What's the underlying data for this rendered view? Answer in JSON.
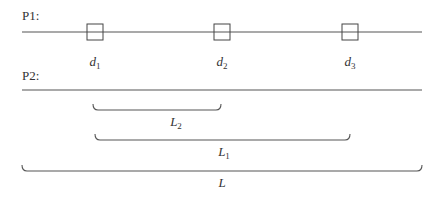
{
  "diagram": {
    "rows": [
      {
        "id": "p1",
        "label": "P1:"
      },
      {
        "id": "p2",
        "label": "P2:"
      }
    ],
    "markers": [
      {
        "id": "d1",
        "symbol": "d",
        "subscript": "1",
        "x_center": 95
      },
      {
        "id": "d2",
        "symbol": "d",
        "subscript": "2",
        "x_center": 222
      },
      {
        "id": "d3",
        "symbol": "d",
        "subscript": "3",
        "x_center": 350
      }
    ],
    "braces": [
      {
        "id": "L2",
        "symbol": "L",
        "subscript": "2",
        "x_start": 93,
        "x_end": 221,
        "label_x": 174
      },
      {
        "id": "L1",
        "symbol": "L",
        "subscript": "1",
        "x_start": 95,
        "x_end": 350,
        "label_x": 222
      },
      {
        "id": "L",
        "symbol": "L",
        "subscript": "",
        "x_start": 22,
        "x_end": 422,
        "label_x": 222
      }
    ],
    "colors": {
      "line": "#555555",
      "text": "#333333",
      "background": "#ffffff"
    }
  }
}
